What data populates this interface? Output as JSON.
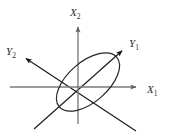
{
  "figure": {
    "background_color": "#ffffff",
    "width": 170,
    "height": 138,
    "origin": {
      "x": 78,
      "y": 87
    }
  },
  "colors": {
    "original_axis": "#7a7a7a",
    "rotated_axis": "#1a1a1a",
    "ellipse": "#262626",
    "label_text": "#2b2b2b"
  },
  "axes": [
    {
      "id": "x1",
      "name": "X1",
      "label_base": "X",
      "label_subscript": "1",
      "kind": "original",
      "orientation": "horizontal",
      "color": "#7a7a7a",
      "arrow": true,
      "label_position": {
        "x": 147,
        "y": 93
      },
      "start": {
        "x": 10,
        "y": 87
      },
      "end": {
        "x": 141,
        "y": 87
      }
    },
    {
      "id": "x2",
      "name": "X2",
      "label_base": "X",
      "label_subscript": "2",
      "kind": "original",
      "orientation": "vertical",
      "color": "#7a7a7a",
      "arrow": true,
      "label_position": {
        "x": 71,
        "y": 16
      },
      "start": {
        "x": 78,
        "y": 124
      },
      "end": {
        "x": 78,
        "y": 22
      }
    },
    {
      "id": "y1",
      "name": "Y1",
      "label_base": "Y",
      "label_subscript": "1",
      "kind": "rotated",
      "orientation": "diagonal-up-right",
      "color": "#1a1a1a",
      "arrow": true,
      "label_position": {
        "x": 130,
        "y": 47
      },
      "start": {
        "x": 34,
        "y": 129
      },
      "end": {
        "x": 124,
        "y": 49
      }
    },
    {
      "id": "y2",
      "name": "Y2",
      "label_base": "Y",
      "label_subscript": "2",
      "kind": "rotated",
      "orientation": "diagonal-up-left",
      "color": "#1a1a1a",
      "arrow": true,
      "label_position": {
        "x": 6,
        "y": 55
      },
      "start": {
        "x": 136,
        "y": 131
      },
      "end": {
        "x": 24,
        "y": 57
      }
    }
  ],
  "ellipse": {
    "name": "tilted-ellipse",
    "center": {
      "x": 88,
      "y": 82
    },
    "semi_major": 38,
    "semi_minor": 20,
    "rotation_degrees": -41,
    "stroke_color": "#262626",
    "stroke_width": 1.2,
    "fill": "none",
    "aligned_with_axis": "Y1"
  }
}
